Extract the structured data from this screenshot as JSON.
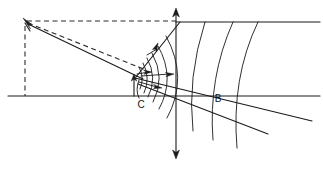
{
  "figure": {
    "type": "line-diagram",
    "background_color": "#ffffff",
    "line_color": "#1a1a1a",
    "labels": [
      {
        "id": "label-b",
        "text": "B",
        "x": 218,
        "y": 99
      },
      {
        "id": "label-c",
        "text": "C",
        "x": 141,
        "y": 105
      }
    ],
    "axes": {
      "baseline": {
        "name": "horizontal-baseline",
        "x1": 8,
        "y1": 96,
        "x2": 320,
        "y2": 96
      },
      "upper_horizontal": {
        "name": "upper-horizontal-line",
        "x1": 176,
        "y1": 22,
        "x2": 320,
        "y2": 22
      },
      "vertical": {
        "name": "vertical-axis",
        "x": 176,
        "y_top": 10,
        "y_bottom": 157
      }
    },
    "apex": {
      "name": "apex-point",
      "x": 25,
      "y": 21
    },
    "fan_origin": {
      "name": "fan-origin",
      "x": 135,
      "y": 78
    },
    "arrow_count": 4,
    "arc_count": 9,
    "radial_count": 2
  }
}
